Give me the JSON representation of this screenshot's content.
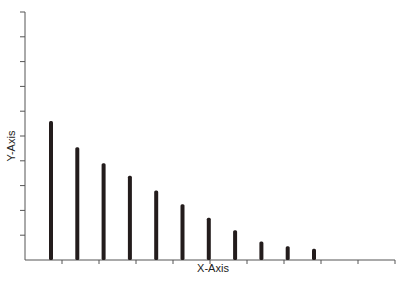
{
  "chart_data": {
    "type": "bar",
    "title": "",
    "xlabel": "X-Axis",
    "ylabel": "Y-Axis",
    "categories": [
      "1",
      "2",
      "3",
      "4",
      "5",
      "6",
      "7",
      "8",
      "9",
      "10",
      "11"
    ],
    "values": [
      5.6,
      4.55,
      3.9,
      3.4,
      2.8,
      2.25,
      1.7,
      1.2,
      0.75,
      0.55,
      0.45
    ],
    "ylim": [
      0,
      10
    ],
    "y_tick_count": 10,
    "x_tick_count": 10,
    "tick_labels_shown": false,
    "grid": false,
    "legend": null,
    "bar_color": "#231c1c"
  },
  "layout": {
    "origin_x": 25,
    "origin_y": 260,
    "x_axis_end": 395,
    "y_axis_top": 12,
    "y_tick_spacing": 24.8,
    "x_tick_spacing": 37,
    "bar_start_x": 51,
    "bar_spacing": 26.3,
    "bar_width": 4
  }
}
